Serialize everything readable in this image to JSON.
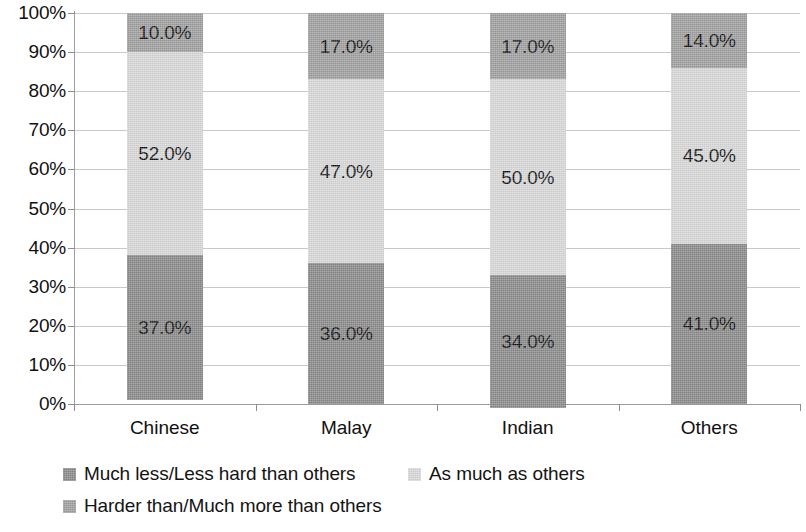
{
  "chart_data": {
    "type": "bar",
    "subtype": "100% stacked column",
    "title": "",
    "xlabel": "",
    "ylabel": "",
    "categories": [
      "Chinese",
      "Malay",
      "Indian",
      "Others"
    ],
    "series": [
      {
        "name": "Much less/Less hard than others",
        "color": "#878787",
        "values": [
          37.0,
          36.0,
          34.0,
          41.0
        ],
        "labels": [
          "37.0%",
          "36.0%",
          "34.0%",
          "41.0%"
        ]
      },
      {
        "name": "As much as others",
        "color": "#d6d6d6",
        "values": [
          52.0,
          47.0,
          50.0,
          45.0
        ],
        "labels": [
          "52.0%",
          "47.0%",
          "50.0%",
          "45.0%"
        ]
      },
      {
        "name": "Harder than/Much more than others",
        "color": "#9c9c9c",
        "values": [
          10.0,
          17.0,
          17.0,
          14.0
        ],
        "labels": [
          "10.0%",
          "17.0%",
          "17.0%",
          "14.0%"
        ]
      }
    ],
    "ylim": [
      0,
      100
    ],
    "y_ticks": [
      0,
      10,
      20,
      30,
      40,
      50,
      60,
      70,
      80,
      90,
      100
    ],
    "y_tick_labels": [
      "0%",
      "10%",
      "20%",
      "30%",
      "40%",
      "50%",
      "60%",
      "70%",
      "80%",
      "90%",
      "100%"
    ],
    "grid": true,
    "grid_axis": "y",
    "legend_position": "bottom-left",
    "stack_order_bottom_to_top": [
      "Much less/Less hard than others",
      "As much as others",
      "Harder than/Much more than others"
    ]
  },
  "axis": {
    "y_tick_labels": [
      "100%",
      "90%",
      "80%",
      "70%",
      "60%",
      "50%",
      "40%",
      "30%",
      "20%",
      "10%",
      "0%"
    ],
    "x_tick_labels": [
      "Chinese",
      "Malay",
      "Indian",
      "Others"
    ]
  },
  "legend": {
    "rows": [
      [
        {
          "label": "Much less/Less hard than others",
          "color": "#878787"
        },
        {
          "label": "As much as others",
          "color": "#d6d6d6"
        }
      ],
      [
        {
          "label": "Harder than/Much more than others",
          "color": "#9c9c9c"
        }
      ]
    ]
  }
}
